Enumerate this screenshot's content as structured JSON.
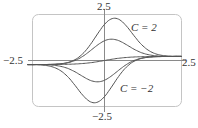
{
  "chart_data": {
    "type": "line",
    "title": "",
    "xlabel": "",
    "ylabel": "",
    "xlim": [
      -2.5,
      2.5
    ],
    "ylim": [
      -2.5,
      2.5
    ],
    "grid": false,
    "tick_labels": {
      "x_left": "−2.5",
      "x_right": "2.5",
      "y_top": "2.5",
      "y_bottom": "−2.5"
    },
    "annotations": [
      {
        "text": "C = 2",
        "near": "top curve"
      },
      {
        "text": "C = −2",
        "near": "bottom curve"
      }
    ],
    "series": [
      {
        "name": "C = 2",
        "C": 2
      },
      {
        "name": "C = 1",
        "C": 1
      },
      {
        "name": "C = 0",
        "C": 0
      },
      {
        "name": "C = -1",
        "C": -1
      },
      {
        "name": "C = -2",
        "C": -2
      }
    ],
    "curve_color": "#555555",
    "axis_color": "#888888",
    "frame_color": "#bbbbbb"
  },
  "labels": {
    "x_left": "−2.5",
    "x_right": "2.5",
    "y_top": "2.5",
    "y_bottom": "−2.5",
    "c_top": "C = 2",
    "c_bottom": "C = −2"
  }
}
